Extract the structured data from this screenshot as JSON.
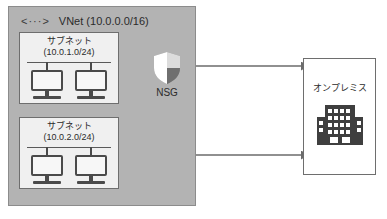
{
  "diagram": {
    "colors": {
      "vnet_fill": "#b3b3b3",
      "vnet_border": "#8c8c8c",
      "subnet_fill": "#f0f0f0",
      "subnet_border": "#6e6e6e",
      "onprem_fill": "#ffffff",
      "onprem_border": "#6e6e6e",
      "icon_dark": "#4a4a4a",
      "arrow": "#6b6b6b",
      "text": "#2b2b2b"
    }
  },
  "vnet": {
    "glyph": "<···>",
    "glyph_icon_name": "vnet-code-icon",
    "title": "VNet (10.0.0.0/16)",
    "subnets": [
      {
        "name": "サブネット",
        "cidr": "(10.0.1.0/24)",
        "hosts": [
          {
            "icon": "monitor-icon"
          },
          {
            "icon": "monitor-icon"
          }
        ]
      },
      {
        "name": "サブネット",
        "cidr": "(10.0.2.0/24)",
        "hosts": [
          {
            "icon": "monitor-icon"
          },
          {
            "icon": "monitor-icon"
          }
        ]
      }
    ]
  },
  "nsg": {
    "label": "NSG",
    "icon": "shield-icon"
  },
  "onpremises": {
    "label": "オンプレミス",
    "icon": "office-building-icon"
  },
  "connections": [
    {
      "id": "subnet1-to-onprem",
      "from": "サブネット (10.0.1.0/24)",
      "to": "オンプレミス",
      "via": "NSG",
      "direction": "bidirectional"
    },
    {
      "id": "subnet2-to-onprem",
      "from": "サブネット (10.0.2.0/24)",
      "to": "オンプレミス",
      "via": "",
      "direction": "bidirectional"
    }
  ]
}
